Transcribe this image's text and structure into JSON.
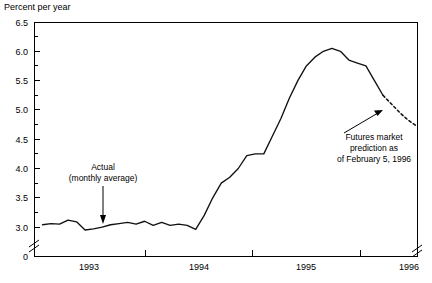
{
  "chart_data": {
    "type": "line",
    "title": "",
    "ylabel": "Percent per year",
    "xlabel": "",
    "grid": false,
    "legend_position": "none",
    "ylim": [
      2.75,
      6.5
    ],
    "ytick_labels": [
      "0",
      "3.0",
      "3.5",
      "4.0",
      "4.5",
      "5.0",
      "5.5",
      "6.0",
      "6.5"
    ],
    "ytick_values": [
      0,
      3.0,
      3.5,
      4.0,
      4.5,
      5.0,
      5.5,
      6.0,
      6.5
    ],
    "yminor_values": [
      3.25,
      3.75,
      4.25,
      4.75,
      5.25,
      5.75,
      6.25
    ],
    "axis_break_y": true,
    "axis_break_x": true,
    "xtick_labels": [
      "1993",
      "1994",
      "1995",
      "1996"
    ],
    "xlim": [
      "1992-09",
      "1996-06"
    ],
    "series": [
      {
        "name": "Actual (monthly average)",
        "style": "solid",
        "x": [
          "1992-10",
          "1992-11",
          "1992-12",
          "1993-01",
          "1993-02",
          "1993-03",
          "1993-04",
          "1993-05",
          "1993-06",
          "1993-07",
          "1993-08",
          "1993-09",
          "1993-10",
          "1993-11",
          "1993-12",
          "1994-01",
          "1994-02",
          "1994-03",
          "1994-04",
          "1994-05",
          "1994-06",
          "1994-07",
          "1994-08",
          "1994-09",
          "1994-10",
          "1994-11",
          "1994-12",
          "1995-01",
          "1995-02",
          "1995-03",
          "1995-04",
          "1995-05",
          "1995-06",
          "1995-07",
          "1995-08",
          "1995-09",
          "1995-10",
          "1995-11",
          "1995-12",
          "1996-01",
          "1996-02"
        ],
        "y": [
          3.04,
          3.06,
          3.05,
          3.12,
          3.09,
          2.95,
          2.97,
          3.0,
          3.04,
          3.06,
          3.08,
          3.05,
          3.1,
          3.03,
          3.08,
          3.03,
          3.05,
          3.03,
          2.96,
          3.2,
          3.5,
          3.75,
          3.85,
          4.0,
          4.22,
          4.25,
          4.25,
          4.55,
          4.85,
          5.2,
          5.5,
          5.75,
          5.9,
          6.0,
          6.05,
          6.0,
          5.85,
          5.8,
          5.75,
          5.75,
          5.7
        ]
      },
      {
        "name": "Futures market prediction as of February 5, 1996",
        "style": "dashed",
        "x": [
          "1996-02",
          "1996-03",
          "1996-04",
          "1996-05",
          "1996-06"
        ],
        "y": [
          5.25,
          5.1,
          4.95,
          4.82,
          4.72
        ]
      }
    ],
    "series_tail_solid": {
      "note": "solid actual line final descent",
      "x": [
        "1995-12",
        "1996-01",
        "1996-02"
      ],
      "y": [
        5.75,
        5.5,
        5.25
      ]
    },
    "annotations": [
      {
        "name": "actual-annotation",
        "lines": [
          "Actual",
          "(monthly average)"
        ],
        "text_x": 103,
        "text_y": 168,
        "arrow_from_x": 103,
        "arrow_from_y": 180,
        "arrow_to_x": 103,
        "arrow_to_y": 222
      },
      {
        "name": "futures-annotation",
        "lines": [
          "Futures market",
          "prediction as",
          "of February 5, 1996"
        ],
        "text_x": 372,
        "text_y": 137,
        "arrow_from_x": 340,
        "arrow_from_y": 130,
        "arrow_to_x": 372,
        "arrow_to_y": 112
      }
    ]
  },
  "colors": {
    "line": "#111111",
    "axis": "#000000",
    "background": "#ffffff"
  }
}
